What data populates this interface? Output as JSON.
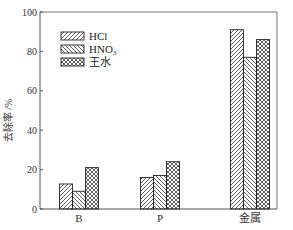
{
  "chart_data": {
    "type": "bar",
    "title": "",
    "xlabel": "",
    "ylabel": "去除率 /%",
    "ylim": [
      0,
      100
    ],
    "yticks": [
      0,
      20,
      40,
      60,
      80,
      100
    ],
    "categories": [
      "B",
      "P",
      "金属"
    ],
    "series": [
      {
        "name": "HCl",
        "pattern": "diagonal-forward",
        "values": [
          12.7,
          16,
          91
        ]
      },
      {
        "name": "HNO3",
        "display_name": "HNO₃",
        "pattern": "diagonal-backward",
        "values": [
          9,
          17,
          77
        ]
      },
      {
        "name": "王水",
        "pattern": "crosshatch",
        "values": [
          21,
          24,
          86
        ]
      }
    ],
    "legend_position": "upper-left-inside",
    "grid": false
  },
  "colors": {
    "axis": "#555555",
    "bar_stroke": "#222222",
    "hatch": "#333333",
    "background": "#ffffff"
  }
}
